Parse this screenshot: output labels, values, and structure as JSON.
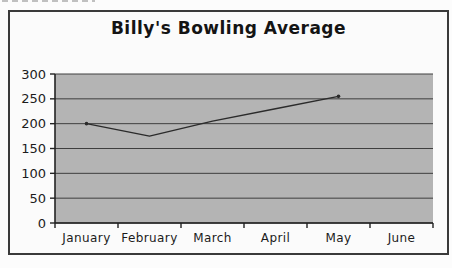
{
  "title": "Billy's Bowling Average",
  "chart_data": {
    "type": "line",
    "title": "Billy's Bowling Average",
    "categories": [
      "January",
      "February",
      "March",
      "April",
      "May",
      "June"
    ],
    "values": [
      200,
      175,
      205,
      230,
      255,
      null
    ],
    "yticks": [
      0,
      50,
      100,
      150,
      200,
      250,
      300
    ],
    "ylim": [
      0,
      300
    ],
    "xlabel": "",
    "ylabel": "",
    "grid": "horizontal",
    "legend": false
  },
  "colors": {
    "paper": "#fcfcfc",
    "frame_border": "#3a3a3a",
    "plot_fill": "#b4b4b4",
    "gridline": "#3f3f3f",
    "axis": "#222222",
    "series_line": "#2b2b2b",
    "text": "#1c1c1c"
  }
}
